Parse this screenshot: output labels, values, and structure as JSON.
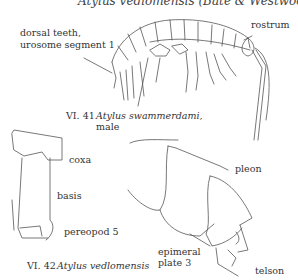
{
  "header": {
    "text": "Atylus vedlomensis (Bate & Westwood) (VI."
  },
  "figure_41": {
    "number": "VI. 41",
    "species": "Atylus swammerdami,",
    "sex": "male",
    "labels": {
      "dorsal_teeth_line1": "dorsal teeth,",
      "dorsal_teeth_line2": "urosome segment 1",
      "rostrum": "rostrum"
    }
  },
  "figure_42": {
    "number": "VI. 42",
    "species": "Atylus vedlomensis",
    "labels": {
      "coxa": "coxa",
      "basis": "basis",
      "pereopod": "pereopod 5",
      "pleon": "pleon",
      "epimeral_line1": "epimeral",
      "epimeral_line2": "plate 3",
      "telson": "telson"
    }
  },
  "colors": {
    "line": "#444444",
    "background": "#ffffff"
  }
}
